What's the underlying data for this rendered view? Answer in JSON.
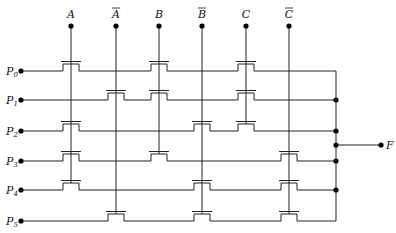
{
  "diagram": {
    "type": "NMOS PLA / pass-transistor logic array",
    "inputs": [
      {
        "label": "A",
        "bar": false,
        "x": 71
      },
      {
        "label": "A",
        "bar": true,
        "x": 116
      },
      {
        "label": "B",
        "bar": false,
        "x": 159
      },
      {
        "label": "B",
        "bar": true,
        "x": 202
      },
      {
        "label": "C",
        "bar": false,
        "x": 246
      },
      {
        "label": "C",
        "bar": true,
        "x": 289
      }
    ],
    "rows": [
      {
        "label": "P",
        "sub": "0",
        "y": 71,
        "transistors": [
          0,
          2,
          4
        ]
      },
      {
        "label": "P",
        "sub": "1",
        "y": 100,
        "transistors": [
          1,
          2,
          4
        ]
      },
      {
        "label": "P",
        "sub": "2",
        "y": 131,
        "transistors": [
          0,
          3,
          4
        ]
      },
      {
        "label": "P",
        "sub": "3",
        "y": 161,
        "transistors": [
          0,
          2,
          5
        ]
      },
      {
        "label": "P",
        "sub": "4",
        "y": 190,
        "transistors": [
          0,
          3,
          5
        ]
      },
      {
        "label": "P",
        "sub": "5",
        "y": 221,
        "transistors": [
          1,
          3,
          5
        ]
      }
    ],
    "output": {
      "label": "F",
      "y": 145,
      "x": 381
    },
    "bus_x": 336,
    "colors": {
      "line": "#222222",
      "background": "#ffffff"
    }
  }
}
